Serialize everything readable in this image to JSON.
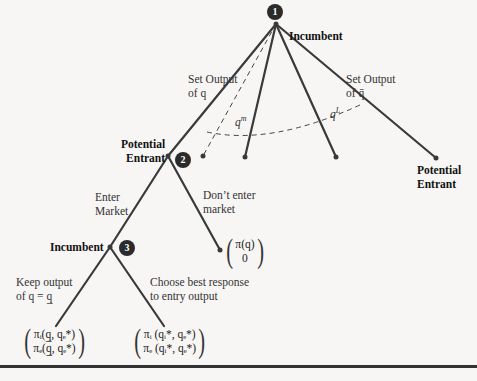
{
  "nodes": [
    {
      "id": 1,
      "badge": "1",
      "player": "Incumbent"
    },
    {
      "id": 2,
      "badge": "2",
      "player_line1": "Potential",
      "player_line2": "Entrant"
    },
    {
      "id": 3,
      "badge": "3",
      "player": "Incumbent"
    }
  ],
  "terminal_right": {
    "line1": "Potential",
    "line2": "Entrant"
  },
  "branches": {
    "set_output_q_line1": "Set Output",
    "set_output_q_line2": "of q",
    "set_output_qbar_line1": "Set Output",
    "set_output_qbar_line2": "of q̄",
    "qm": "q",
    "qm_sup": "m",
    "qL": "q",
    "qL_sup": "L",
    "enter_line1": "Enter",
    "enter_line2": "Market",
    "dont_enter_line1": "Don’t enter",
    "dont_enter_line2": "market",
    "keep_line1": "Keep output",
    "keep_line2": "of q = q̲",
    "best_line1": "Choose best response",
    "best_line2": "to entry output"
  },
  "payoffs": {
    "no_entry": {
      "top": "π(q)",
      "bottom": "0"
    },
    "keep": {
      "top": "πᵢ(q̲, qₑ*)",
      "bottom": "πₑ(q̲, qₑ*)"
    },
    "best": {
      "top": "πᵢ (qᵢ*, qₑ*)",
      "bottom": "πₑ (qᵢ*, qₑ*)"
    }
  }
}
